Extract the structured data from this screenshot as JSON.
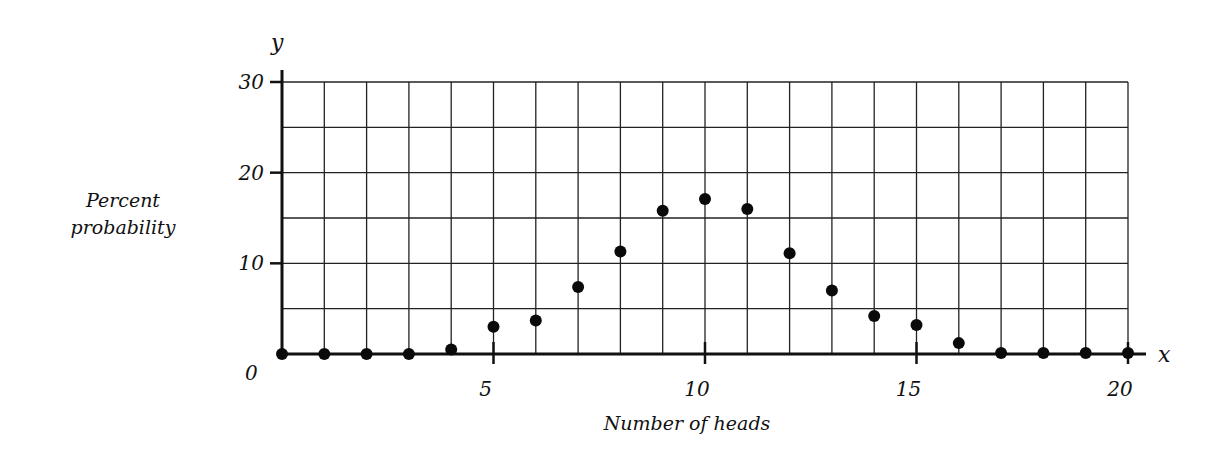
{
  "chart_data": {
    "type": "scatter",
    "title": "",
    "xlabel": "Number of heads",
    "ylabel": "Percent probability",
    "x_axis_symbol": "x",
    "y_axis_symbol": "y",
    "xlim": [
      0,
      20
    ],
    "ylim": [
      0,
      30
    ],
    "x_ticks": [
      0,
      5,
      10,
      15,
      20
    ],
    "x_tick_labels": [
      "0",
      "5",
      "10",
      "15",
      "20"
    ],
    "y_ticks": [
      10,
      20,
      30
    ],
    "y_tick_labels": [
      "10",
      "20",
      "30"
    ],
    "origin_label": "0",
    "grid": true,
    "grid_x_step": 1,
    "grid_y_step": 5,
    "legend": null,
    "x": [
      0,
      1,
      2,
      3,
      4,
      5,
      6,
      7,
      8,
      9,
      10,
      11,
      12,
      13,
      14,
      15,
      16,
      17,
      18,
      19,
      20
    ],
    "values": [
      0,
      0,
      0,
      0,
      0.5,
      3,
      3.7,
      7.4,
      11.3,
      15.8,
      17.1,
      16,
      11.1,
      7,
      4.2,
      3.2,
      1.2,
      0.1,
      0.1,
      0.1,
      0.1
    ]
  }
}
